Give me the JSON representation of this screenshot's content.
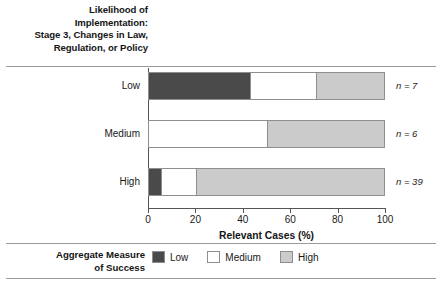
{
  "chart_data": {
    "type": "bar",
    "orientation": "horizontal",
    "stacked": true,
    "normalized": true,
    "title": "Likelihood of Implementation: Stage 3, Changes in Law, Regulation, or Policy",
    "title_lines": [
      "Likelihood of",
      "Implementation:",
      "Stage 3, Changes in Law,",
      "Regulation, or Policy"
    ],
    "xlabel": "Relevant Cases (%)",
    "ylabel": "",
    "xlim": [
      0,
      100
    ],
    "xticks": [
      0,
      20,
      40,
      60,
      80,
      100
    ],
    "xtick_labels": [
      "0",
      "20",
      "40",
      "60",
      "80",
      "100"
    ],
    "grid": false,
    "categories": [
      "Low",
      "Medium",
      "High"
    ],
    "series": [
      {
        "name": "Low",
        "color": "#4a4a4a",
        "values": [
          43,
          0,
          5
        ]
      },
      {
        "name": "Medium",
        "color": "#ffffff",
        "values": [
          28,
          50,
          15
        ]
      },
      {
        "name": "High",
        "color": "#cbcbcb",
        "values": [
          29,
          50,
          80
        ]
      }
    ],
    "annotations": [
      {
        "category": "Low",
        "text": "n = 7",
        "value": 7
      },
      {
        "category": "Medium",
        "text": "n = 6",
        "value": 6
      },
      {
        "category": "High",
        "text": "n = 39",
        "value": 39
      }
    ],
    "legend": {
      "title_lines": [
        "Aggregate Measure",
        "of Success"
      ],
      "position": "bottom",
      "entries": [
        {
          "label": "Low",
          "color": "#4a4a4a"
        },
        {
          "label": "Medium",
          "color": "#ffffff"
        },
        {
          "label": "High",
          "color": "#cbcbcb"
        }
      ]
    }
  }
}
